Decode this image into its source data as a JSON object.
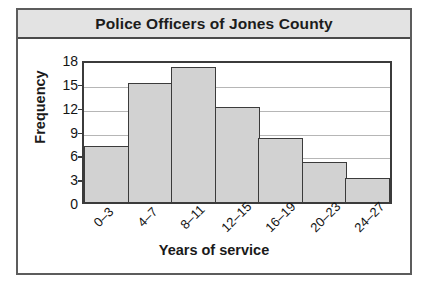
{
  "chart_data": {
    "type": "bar",
    "title": "Police Officers of Jones County",
    "xlabel": "Years of service",
    "ylabel": "Frequency",
    "categories": [
      "0–3",
      "4–7",
      "8–11",
      "12–15",
      "16–19",
      "20–23",
      "24–27"
    ],
    "values": [
      7,
      15,
      17,
      12,
      8,
      5,
      3
    ],
    "yticks": [
      0,
      3,
      6,
      9,
      12,
      15,
      18
    ],
    "ylim": [
      0,
      18
    ],
    "grid": true,
    "legend": "none",
    "colors": {
      "bar_fill": "#d2d2d2",
      "bar_border": "#3b3b3b",
      "gridline": "#b6b6b6",
      "title_bg": "#e3e3e3",
      "frame": "#5c5c5c",
      "text": "#141414"
    }
  }
}
